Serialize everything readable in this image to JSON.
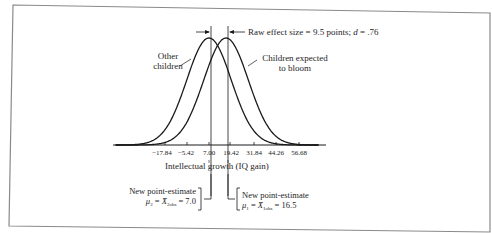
{
  "figure": {
    "effect_annotation": {
      "prefix": "Raw effect size = 9.5 points; ",
      "d_symbol": "d",
      "d_value": " = .76"
    },
    "curve_labels": {
      "other": [
        "Other",
        "children"
      ],
      "bloom": [
        "Children expected",
        "to bloom"
      ]
    },
    "x_axis": {
      "label": "Intellectual growth (IQ gain)",
      "ticks": [
        "−17.84",
        "−5.42",
        "7.00",
        "19.42",
        "31.84",
        "44.26",
        "56.68"
      ]
    },
    "estimates": {
      "left": {
        "title": "New point-estimate",
        "mu": "μ",
        "mu_sub": "2",
        "xbar": "X̄",
        "xbar_sub": "2obs",
        "value": " = 7.0"
      },
      "right": {
        "title": "New point-estimate",
        "mu": "μ",
        "mu_sub": "1",
        "xbar": "X̄",
        "xbar_sub": "1obs",
        "value": " = 16.5"
      }
    },
    "colors": {
      "line": "#1a1a1a",
      "frame": "#8a8a8a",
      "background": "#ffffff"
    }
  },
  "chart_data": {
    "type": "line",
    "title": "",
    "xlabel": "Intellectual growth (IQ gain)",
    "ylabel": "",
    "x_ticks": [
      -17.84,
      -5.42,
      7.0,
      19.42,
      31.84,
      44.26,
      56.68
    ],
    "series": [
      {
        "name": "Other children",
        "distribution": "normal",
        "mean": 7.0,
        "sd": 12.42
      },
      {
        "name": "Children expected to bloom",
        "distribution": "normal",
        "mean": 16.5,
        "sd": 12.42
      }
    ],
    "annotations": [
      "Raw effect size = 9.5 points; d = .76",
      "New point-estimate μ2 = X̄2obs = 7.0",
      "New point-estimate μ1 = X̄1obs = 16.5"
    ],
    "grid": false,
    "legend": "none"
  }
}
